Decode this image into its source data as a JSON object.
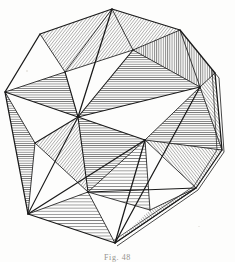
{
  "plate": {
    "caption": "Fig. 48",
    "title": "Icosahedron",
    "medium": "engraved line drawing with hatch shading",
    "ink_color": "#1a1a1a",
    "paper_color": "#fdfdfc",
    "caption_color": "#7d7b74",
    "width": 235,
    "height": 262
  },
  "figure": {
    "name": "icosahedron-line-drawing",
    "stroke_width_outline": 1.15,
    "stroke_width_inner": 0.85,
    "hatch_stroke_width": 0.5,
    "hatch_spacing": 2.2,
    "outer_hull": [
      [
        112,
        9
      ],
      [
        180,
        30
      ],
      [
        215,
        73
      ],
      [
        222,
        150
      ],
      [
        196,
        188
      ],
      [
        115,
        243
      ],
      [
        28,
        214
      ],
      [
        5,
        92
      ],
      [
        40,
        34
      ]
    ],
    "vertices": {
      "top": [
        112,
        9
      ],
      "upper_right": [
        180,
        30
      ],
      "right": [
        215,
        73
      ],
      "lower_right": [
        222,
        150
      ],
      "right_foot": [
        196,
        188
      ],
      "bottom": [
        115,
        243
      ],
      "lower_left": [
        28,
        214
      ],
      "left": [
        5,
        92
      ],
      "upper_left": [
        40,
        34
      ],
      "center": [
        78,
        117
      ],
      "inner_right": [
        200,
        87
      ],
      "inner_mid_right": [
        145,
        140
      ],
      "inner_low": [
        150,
        210
      ],
      "inner_upper": [
        65,
        72
      ],
      "inner_left_low": [
        35,
        143
      ],
      "inner_bottom_left": [
        88,
        192
      ],
      "inner_top_mid": [
        133,
        50
      ]
    },
    "hatch_angles_deg": {
      "horizontal": 0,
      "vertical": 90,
      "diagonal": 38
    }
  }
}
